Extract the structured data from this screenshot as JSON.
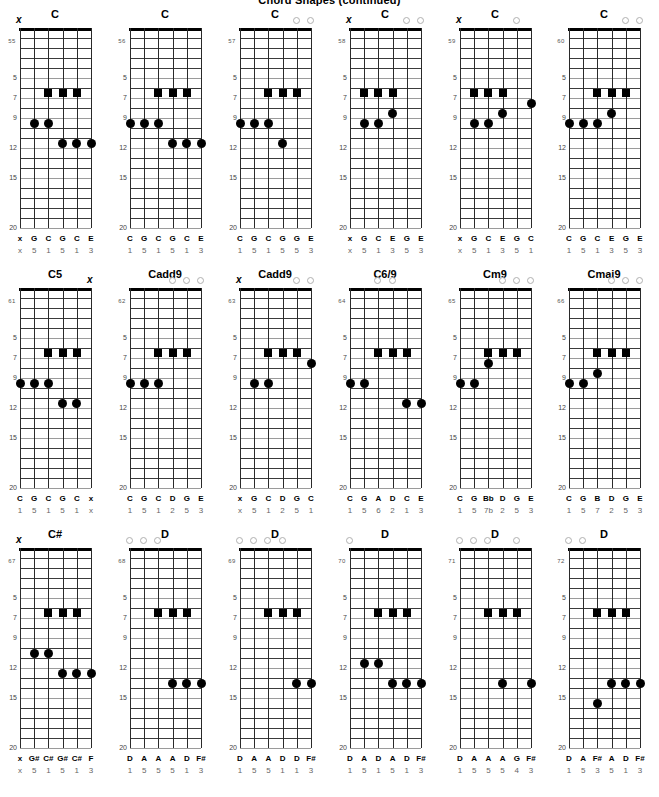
{
  "page": {
    "title": "Chord Shapes (continued)",
    "fret_numbers": [
      5,
      7,
      9,
      12,
      15,
      20
    ],
    "total_frets": 20,
    "strings": 6,
    "colors": {
      "ink": "#000000",
      "fret_line": "#3a3a3a",
      "fret_line_light": "#9a9a9a",
      "label_muted": "#666666",
      "open_circle_stroke": "#b0b0b0"
    },
    "marker_legend": {
      "square": "root-or-barre-note",
      "filled_circle": "fretted-note",
      "open_circle": "open-string",
      "x": "muted-string"
    }
  },
  "diagrams": [
    {
      "num": "55",
      "name": "C",
      "top_markers": [
        "x",
        "",
        "",
        "",
        "",
        ""
      ],
      "markers": [
        {
          "string": 2,
          "fret": 7,
          "shape": "square"
        },
        {
          "string": 3,
          "fret": 7,
          "shape": "square"
        },
        {
          "string": 4,
          "fret": 7,
          "shape": "square"
        },
        {
          "string": 1,
          "fret": 10,
          "shape": "circle"
        },
        {
          "string": 2,
          "fret": 10,
          "shape": "circle"
        },
        {
          "string": 3,
          "fret": 12,
          "shape": "circle"
        },
        {
          "string": 4,
          "fret": 12,
          "shape": "circle"
        },
        {
          "string": 5,
          "fret": 12,
          "shape": "circle"
        }
      ],
      "notes": [
        "x",
        "G",
        "C",
        "G",
        "C",
        "E"
      ],
      "degrees": [
        "x",
        "5",
        "1",
        "5",
        "1",
        "3"
      ]
    },
    {
      "num": "56",
      "name": "C",
      "top_markers": [
        "",
        "",
        "",
        "",
        "",
        ""
      ],
      "markers": [
        {
          "string": 2,
          "fret": 7,
          "shape": "square"
        },
        {
          "string": 3,
          "fret": 7,
          "shape": "square"
        },
        {
          "string": 4,
          "fret": 7,
          "shape": "square"
        },
        {
          "string": 0,
          "fret": 10,
          "shape": "circle"
        },
        {
          "string": 1,
          "fret": 10,
          "shape": "circle"
        },
        {
          "string": 2,
          "fret": 10,
          "shape": "circle"
        },
        {
          "string": 3,
          "fret": 12,
          "shape": "circle"
        },
        {
          "string": 4,
          "fret": 12,
          "shape": "circle"
        },
        {
          "string": 5,
          "fret": 12,
          "shape": "circle"
        }
      ],
      "notes": [
        "C",
        "G",
        "C",
        "G",
        "C",
        "E"
      ],
      "degrees": [
        "1",
        "5",
        "1",
        "5",
        "1",
        "3"
      ]
    },
    {
      "num": "57",
      "name": "C",
      "top_markers": [
        "",
        "",
        "",
        "",
        "o",
        "o"
      ],
      "markers": [
        {
          "string": 2,
          "fret": 7,
          "shape": "square"
        },
        {
          "string": 3,
          "fret": 7,
          "shape": "square"
        },
        {
          "string": 4,
          "fret": 7,
          "shape": "square"
        },
        {
          "string": 0,
          "fret": 10,
          "shape": "circle"
        },
        {
          "string": 1,
          "fret": 10,
          "shape": "circle"
        },
        {
          "string": 2,
          "fret": 10,
          "shape": "circle"
        },
        {
          "string": 3,
          "fret": 12,
          "shape": "circle"
        }
      ],
      "notes": [
        "C",
        "G",
        "C",
        "G",
        "G",
        "E"
      ],
      "degrees": [
        "1",
        "5",
        "1",
        "5",
        "5",
        "3"
      ]
    },
    {
      "num": "58",
      "name": "C",
      "top_markers": [
        "x",
        "",
        "",
        "",
        "o",
        "o"
      ],
      "markers": [
        {
          "string": 1,
          "fret": 7,
          "shape": "square"
        },
        {
          "string": 2,
          "fret": 7,
          "shape": "square"
        },
        {
          "string": 3,
          "fret": 7,
          "shape": "square"
        },
        {
          "string": 3,
          "fret": 9,
          "shape": "circle"
        },
        {
          "string": 1,
          "fret": 10,
          "shape": "circle"
        },
        {
          "string": 2,
          "fret": 10,
          "shape": "circle"
        }
      ],
      "notes": [
        "x",
        "G",
        "C",
        "E",
        "G",
        "E"
      ],
      "degrees": [
        "x",
        "5",
        "1",
        "3",
        "5",
        "3"
      ]
    },
    {
      "num": "59",
      "name": "C",
      "top_markers": [
        "x",
        "",
        "",
        "",
        "o",
        ""
      ],
      "markers": [
        {
          "string": 1,
          "fret": 7,
          "shape": "square"
        },
        {
          "string": 2,
          "fret": 7,
          "shape": "square"
        },
        {
          "string": 3,
          "fret": 7,
          "shape": "square"
        },
        {
          "string": 5,
          "fret": 8,
          "shape": "circle"
        },
        {
          "string": 3,
          "fret": 9,
          "shape": "circle"
        },
        {
          "string": 1,
          "fret": 10,
          "shape": "circle"
        },
        {
          "string": 2,
          "fret": 10,
          "shape": "circle"
        }
      ],
      "notes": [
        "x",
        "G",
        "C",
        "E",
        "G",
        "C"
      ],
      "degrees": [
        "x",
        "5",
        "1",
        "3",
        "5",
        "1"
      ]
    },
    {
      "num": "60",
      "name": "C",
      "top_markers": [
        "",
        "",
        "",
        "",
        "o",
        "o"
      ],
      "markers": [
        {
          "string": 2,
          "fret": 7,
          "shape": "square"
        },
        {
          "string": 3,
          "fret": 7,
          "shape": "square"
        },
        {
          "string": 4,
          "fret": 7,
          "shape": "square"
        },
        {
          "string": 3,
          "fret": 9,
          "shape": "circle"
        },
        {
          "string": 0,
          "fret": 10,
          "shape": "circle"
        },
        {
          "string": 1,
          "fret": 10,
          "shape": "circle"
        },
        {
          "string": 2,
          "fret": 10,
          "shape": "circle"
        }
      ],
      "notes": [
        "C",
        "G",
        "C",
        "E",
        "G",
        "E"
      ],
      "degrees": [
        "1",
        "5",
        "1",
        "3",
        "5",
        "3"
      ]
    },
    {
      "num": "61",
      "name": "C5",
      "top_markers": [
        "",
        "",
        "",
        "",
        "",
        "x"
      ],
      "markers": [
        {
          "string": 2,
          "fret": 7,
          "shape": "square"
        },
        {
          "string": 3,
          "fret": 7,
          "shape": "square"
        },
        {
          "string": 4,
          "fret": 7,
          "shape": "square"
        },
        {
          "string": 0,
          "fret": 10,
          "shape": "circle"
        },
        {
          "string": 1,
          "fret": 10,
          "shape": "circle"
        },
        {
          "string": 2,
          "fret": 10,
          "shape": "circle"
        },
        {
          "string": 3,
          "fret": 12,
          "shape": "circle"
        },
        {
          "string": 4,
          "fret": 12,
          "shape": "circle"
        }
      ],
      "notes": [
        "C",
        "G",
        "C",
        "G",
        "C",
        "x"
      ],
      "degrees": [
        "1",
        "5",
        "1",
        "5",
        "1",
        "x"
      ]
    },
    {
      "num": "62",
      "name": "Cadd9",
      "top_markers": [
        "",
        "",
        "",
        "o",
        "o",
        "o"
      ],
      "markers": [
        {
          "string": 2,
          "fret": 7,
          "shape": "square"
        },
        {
          "string": 3,
          "fret": 7,
          "shape": "square"
        },
        {
          "string": 4,
          "fret": 7,
          "shape": "square"
        },
        {
          "string": 0,
          "fret": 10,
          "shape": "circle"
        },
        {
          "string": 1,
          "fret": 10,
          "shape": "circle"
        },
        {
          "string": 2,
          "fret": 10,
          "shape": "circle"
        }
      ],
      "notes": [
        "C",
        "G",
        "C",
        "D",
        "G",
        "E"
      ],
      "degrees": [
        "1",
        "5",
        "1",
        "2",
        "5",
        "3"
      ]
    },
    {
      "num": "63",
      "name": "Cadd9",
      "top_markers": [
        "x",
        "",
        "",
        "",
        "o",
        "o"
      ],
      "markers": [
        {
          "string": 2,
          "fret": 7,
          "shape": "square"
        },
        {
          "string": 3,
          "fret": 7,
          "shape": "square"
        },
        {
          "string": 4,
          "fret": 7,
          "shape": "square"
        },
        {
          "string": 5,
          "fret": 8,
          "shape": "circle"
        },
        {
          "string": 1,
          "fret": 10,
          "shape": "circle"
        },
        {
          "string": 2,
          "fret": 10,
          "shape": "circle"
        }
      ],
      "notes": [
        "x",
        "G",
        "C",
        "D",
        "G",
        "C"
      ],
      "degrees": [
        "x",
        "5",
        "1",
        "2",
        "5",
        "1"
      ]
    },
    {
      "num": "64",
      "name": "C6/9",
      "top_markers": [
        "",
        "",
        "o",
        "o",
        "",
        ""
      ],
      "markers": [
        {
          "string": 2,
          "fret": 7,
          "shape": "square"
        },
        {
          "string": 3,
          "fret": 7,
          "shape": "square"
        },
        {
          "string": 4,
          "fret": 7,
          "shape": "square"
        },
        {
          "string": 0,
          "fret": 10,
          "shape": "circle"
        },
        {
          "string": 1,
          "fret": 10,
          "shape": "circle"
        },
        {
          "string": 4,
          "fret": 12,
          "shape": "circle"
        },
        {
          "string": 5,
          "fret": 12,
          "shape": "circle"
        }
      ],
      "notes": [
        "C",
        "G",
        "A",
        "D",
        "C",
        "E"
      ],
      "degrees": [
        "1",
        "5",
        "6",
        "2",
        "1",
        "3"
      ]
    },
    {
      "num": "65",
      "name": "Cm9",
      "top_markers": [
        "",
        "",
        "",
        "o",
        "o",
        "o"
      ],
      "markers": [
        {
          "string": 2,
          "fret": 7,
          "shape": "square"
        },
        {
          "string": 3,
          "fret": 7,
          "shape": "square"
        },
        {
          "string": 4,
          "fret": 7,
          "shape": "square"
        },
        {
          "string": 2,
          "fret": 8,
          "shape": "circle"
        },
        {
          "string": 0,
          "fret": 10,
          "shape": "circle"
        },
        {
          "string": 1,
          "fret": 10,
          "shape": "circle"
        }
      ],
      "notes": [
        "C",
        "G",
        "Bb",
        "D",
        "G",
        "E"
      ],
      "degrees": [
        "1",
        "5",
        "7b",
        "2",
        "5",
        "3"
      ]
    },
    {
      "num": "66",
      "name": "Cmaj9",
      "top_markers": [
        "",
        "",
        "",
        "o",
        "o",
        "o"
      ],
      "markers": [
        {
          "string": 2,
          "fret": 7,
          "shape": "square"
        },
        {
          "string": 3,
          "fret": 7,
          "shape": "square"
        },
        {
          "string": 4,
          "fret": 7,
          "shape": "square"
        },
        {
          "string": 2,
          "fret": 9,
          "shape": "circle"
        },
        {
          "string": 0,
          "fret": 10,
          "shape": "circle"
        },
        {
          "string": 1,
          "fret": 10,
          "shape": "circle"
        }
      ],
      "notes": [
        "C",
        "G",
        "B",
        "D",
        "G",
        "E"
      ],
      "degrees": [
        "1",
        "5",
        "7",
        "2",
        "5",
        "3"
      ]
    },
    {
      "num": "67",
      "name": "C#",
      "top_markers": [
        "x",
        "",
        "",
        "",
        "",
        ""
      ],
      "markers": [
        {
          "string": 2,
          "fret": 7,
          "shape": "square"
        },
        {
          "string": 3,
          "fret": 7,
          "shape": "square"
        },
        {
          "string": 4,
          "fret": 7,
          "shape": "square"
        },
        {
          "string": 1,
          "fret": 11,
          "shape": "circle"
        },
        {
          "string": 2,
          "fret": 11,
          "shape": "circle"
        },
        {
          "string": 3,
          "fret": 13,
          "shape": "circle"
        },
        {
          "string": 4,
          "fret": 13,
          "shape": "circle"
        },
        {
          "string": 5,
          "fret": 13,
          "shape": "circle"
        }
      ],
      "notes": [
        "x",
        "G#",
        "C#",
        "G#",
        "C#",
        "F"
      ],
      "degrees": [
        "x",
        "5",
        "1",
        "5",
        "1",
        "3"
      ]
    },
    {
      "num": "68",
      "name": "D",
      "top_markers": [
        "o",
        "o",
        "o",
        "",
        "",
        ""
      ],
      "markers": [
        {
          "string": 2,
          "fret": 7,
          "shape": "square"
        },
        {
          "string": 3,
          "fret": 7,
          "shape": "square"
        },
        {
          "string": 4,
          "fret": 7,
          "shape": "square"
        },
        {
          "string": 3,
          "fret": 14,
          "shape": "circle"
        },
        {
          "string": 4,
          "fret": 14,
          "shape": "circle"
        },
        {
          "string": 5,
          "fret": 14,
          "shape": "circle"
        }
      ],
      "notes": [
        "D",
        "A",
        "A",
        "A",
        "D",
        "F#"
      ],
      "degrees": [
        "1",
        "5",
        "5",
        "5",
        "1",
        "3"
      ]
    },
    {
      "num": "69",
      "name": "D",
      "top_markers": [
        "o",
        "o",
        "o",
        "o",
        "",
        ""
      ],
      "markers": [
        {
          "string": 2,
          "fret": 7,
          "shape": "square"
        },
        {
          "string": 3,
          "fret": 7,
          "shape": "square"
        },
        {
          "string": 4,
          "fret": 7,
          "shape": "square"
        },
        {
          "string": 4,
          "fret": 14,
          "shape": "circle"
        },
        {
          "string": 5,
          "fret": 14,
          "shape": "circle"
        }
      ],
      "notes": [
        "D",
        "A",
        "A",
        "D",
        "D",
        "F#"
      ],
      "degrees": [
        "1",
        "5",
        "5",
        "1",
        "1",
        "3"
      ]
    },
    {
      "num": "70",
      "name": "D",
      "top_markers": [
        "o",
        "",
        "",
        "",
        "",
        ""
      ],
      "markers": [
        {
          "string": 2,
          "fret": 7,
          "shape": "square"
        },
        {
          "string": 3,
          "fret": 7,
          "shape": "square"
        },
        {
          "string": 4,
          "fret": 7,
          "shape": "square"
        },
        {
          "string": 1,
          "fret": 12,
          "shape": "circle"
        },
        {
          "string": 2,
          "fret": 12,
          "shape": "circle"
        },
        {
          "string": 3,
          "fret": 14,
          "shape": "circle"
        },
        {
          "string": 4,
          "fret": 14,
          "shape": "circle"
        },
        {
          "string": 5,
          "fret": 14,
          "shape": "circle"
        }
      ],
      "notes": [
        "D",
        "A",
        "D",
        "A",
        "D",
        "F#"
      ],
      "degrees": [
        "1",
        "5",
        "1",
        "5",
        "1",
        "3"
      ]
    },
    {
      "num": "71",
      "name": "D",
      "top_markers": [
        "o",
        "o",
        "o",
        "",
        "o",
        ""
      ],
      "markers": [
        {
          "string": 2,
          "fret": 7,
          "shape": "square"
        },
        {
          "string": 3,
          "fret": 7,
          "shape": "square"
        },
        {
          "string": 4,
          "fret": 7,
          "shape": "square"
        },
        {
          "string": 3,
          "fret": 14,
          "shape": "circle"
        },
        {
          "string": 5,
          "fret": 14,
          "shape": "circle"
        }
      ],
      "notes": [
        "D",
        "A",
        "A",
        "A",
        "G",
        "F#"
      ],
      "degrees": [
        "1",
        "5",
        "5",
        "5",
        "4",
        "3"
      ]
    },
    {
      "num": "72",
      "name": "D",
      "top_markers": [
        "o",
        "o",
        "",
        "",
        "",
        ""
      ],
      "markers": [
        {
          "string": 2,
          "fret": 7,
          "shape": "square"
        },
        {
          "string": 3,
          "fret": 7,
          "shape": "square"
        },
        {
          "string": 4,
          "fret": 7,
          "shape": "square"
        },
        {
          "string": 3,
          "fret": 14,
          "shape": "circle"
        },
        {
          "string": 4,
          "fret": 14,
          "shape": "circle"
        },
        {
          "string": 5,
          "fret": 14,
          "shape": "circle"
        },
        {
          "string": 2,
          "fret": 16,
          "shape": "circle"
        }
      ],
      "notes": [
        "D",
        "A",
        "F#",
        "A",
        "D",
        "F#"
      ],
      "degrees": [
        "1",
        "5",
        "3",
        "5",
        "1",
        "3"
      ]
    }
  ]
}
